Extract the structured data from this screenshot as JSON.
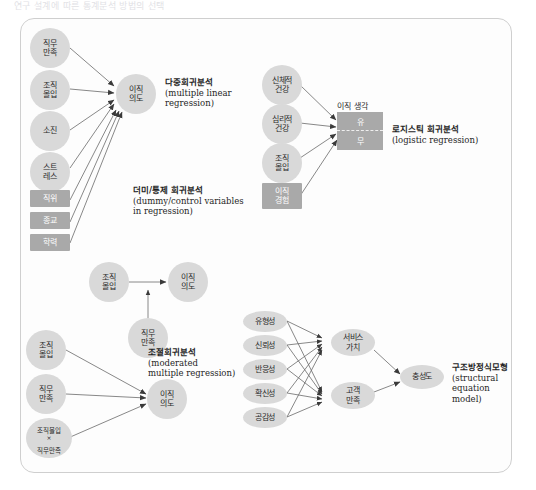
{
  "page": {
    "header_strip": "연구 설계에 따른 통계분석 방법의 선택",
    "background": "#ffffff",
    "frame_border": "#cfcfcf"
  },
  "colors": {
    "node_light": "#d9d9d9",
    "node_dark": "#a9a9a9",
    "text_dark": "#2b2b2b",
    "text_light": "#ffffff",
    "arrow": "#555555"
  },
  "panels": [
    {
      "id": "multiple-linear-regression",
      "caption_ko": "다중회귀분석",
      "caption_en": "(multiple linear\nregression)",
      "predictors": [
        {
          "id": "job-satisfaction",
          "label": "직무\n만족",
          "shape": "circle"
        },
        {
          "id": "org-commitment",
          "label": "조직\n몰입",
          "shape": "circle"
        },
        {
          "id": "burnout",
          "label": "소진",
          "shape": "circle"
        },
        {
          "id": "stress",
          "label": "스트\n레스",
          "shape": "circle"
        }
      ],
      "outcome": {
        "id": "turnover-intention",
        "label": "이직\n의도",
        "shape": "circle"
      }
    },
    {
      "id": "dummy-control-regression",
      "caption_ko": "더미/통제 회귀분석",
      "caption_en": "(dummy/control variables\nin regression)",
      "predictors": [
        {
          "id": "position",
          "label": "직위",
          "shape": "rect"
        },
        {
          "id": "religion",
          "label": "종교",
          "shape": "rect"
        },
        {
          "id": "education",
          "label": "학력",
          "shape": "rect"
        }
      ]
    },
    {
      "id": "logistic-regression",
      "caption_ko": "로지스틱 회귀분석",
      "caption_en": "(logistic regression)",
      "predictors": [
        {
          "id": "physical-health",
          "label": "신체적\n건강",
          "shape": "circle"
        },
        {
          "id": "psychological-health",
          "label": "심리적\n건강",
          "shape": "circle"
        },
        {
          "id": "org-commitment",
          "label": "조직\n몰입",
          "shape": "circle"
        },
        {
          "id": "turnover-experience",
          "label": "이직\n경험",
          "shape": "rect"
        }
      ],
      "outcome": {
        "id": "turnover-thought",
        "caption": "이직 생각",
        "levels": [
          "유",
          "무"
        ]
      }
    },
    {
      "id": "moderated-multiple-regression",
      "caption_ko": "조절회귀분석",
      "caption_en": "(moderated\nmultiple regression)",
      "predictor": {
        "id": "org-commitment",
        "label": "조직\n몰입",
        "shape": "circle"
      },
      "moderator": {
        "id": "job-satisfaction",
        "label": "직무\n만족",
        "shape": "circle"
      },
      "outcome": {
        "id": "turnover-intention",
        "label": "이직\n의도",
        "shape": "circle"
      },
      "expanded_predictors": [
        {
          "id": "org-commitment",
          "label": "조직\n몰입",
          "shape": "circle"
        },
        {
          "id": "job-satisfaction",
          "label": "직무\n만족",
          "shape": "circle"
        },
        {
          "id": "interaction",
          "label": "조직몰입\n직무만족",
          "operator": "×",
          "shape": "circle"
        }
      ],
      "expanded_outcome": {
        "id": "turnover-intention",
        "label": "이직\n의도",
        "shape": "circle"
      }
    },
    {
      "id": "structural-equation-model",
      "caption_ko": "구조방정식모형",
      "caption_en": "(structural equation\nmodel)",
      "exogenous": [
        {
          "id": "tangibles",
          "label": "유형성"
        },
        {
          "id": "reliability",
          "label": "신뢰성"
        },
        {
          "id": "responsiveness",
          "label": "반응성"
        },
        {
          "id": "assurance",
          "label": "확신성"
        },
        {
          "id": "empathy",
          "label": "공감성"
        }
      ],
      "mediators": [
        {
          "id": "service-value",
          "label": "서비스\n가치"
        },
        {
          "id": "customer-satisfaction",
          "label": "고객\n만족"
        }
      ],
      "endogenous": {
        "id": "loyalty",
        "label": "충성도"
      }
    }
  ]
}
